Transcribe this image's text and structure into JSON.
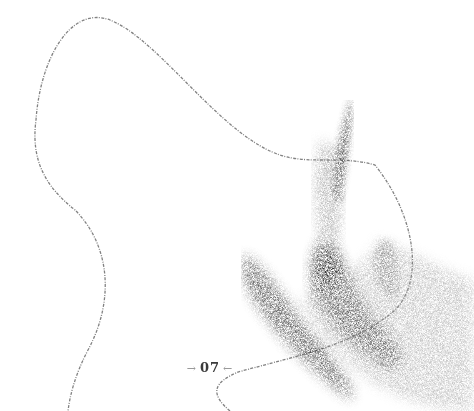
{
  "page": {
    "number": "07",
    "left_arrow": "→",
    "right_arrow": "←"
  },
  "illustration": {
    "description": "stippled abstract brush strokes with a thin flowing line",
    "ink_color": "#5a5a5a"
  }
}
